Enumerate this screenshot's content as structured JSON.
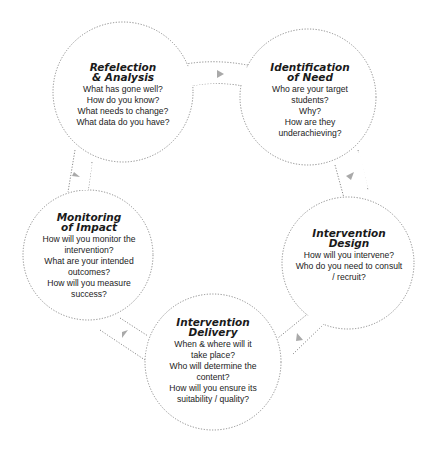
{
  "diagram": {
    "type": "cycle",
    "stages": [
      {
        "id": "reflection",
        "title_lines": [
          "Refelection",
          "& Analysis"
        ],
        "questions": [
          "What has gone well?",
          "How do you know?",
          "What needs to change?",
          "What data do you have?"
        ]
      },
      {
        "id": "identification",
        "title_lines": [
          "Identification",
          "of Need"
        ],
        "questions": [
          "Who are your target",
          "students?",
          "Why?",
          "How are they",
          "underachieving?"
        ]
      },
      {
        "id": "design",
        "title_lines": [
          "Intervention",
          "Design"
        ],
        "questions": [
          "How will you intervene?",
          "Who do you need to consult",
          "/ recruit?"
        ]
      },
      {
        "id": "delivery",
        "title_lines": [
          "Intervention",
          "Delivery"
        ],
        "questions": [
          "When & where will it",
          "take place?",
          "Who will determine the",
          "content?",
          "How will you ensure its",
          "suitability / quality?"
        ]
      },
      {
        "id": "monitoring",
        "title_lines": [
          "Monitoring",
          "of Impact"
        ],
        "questions": [
          "How will you monitor the",
          "intervention?",
          "What are your intended",
          "outcomes?",
          "How will you measure",
          "success?"
        ]
      }
    ],
    "flow": [
      "reflection",
      "identification",
      "design",
      "delivery",
      "monitoring",
      "reflection"
    ],
    "colors": {
      "outline": "#8a8a8a",
      "arrow": "#a9a9a9",
      "text": "#222222"
    }
  }
}
